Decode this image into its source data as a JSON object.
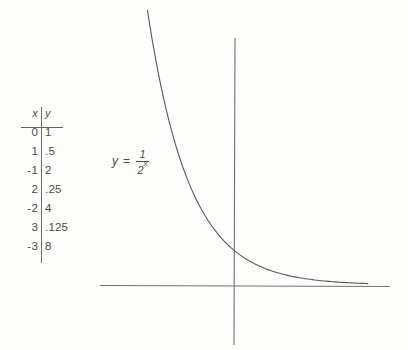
{
  "figure": {
    "kind": "math-graph",
    "background_color": "#fdfdfc",
    "stroke_color": "#5e5e63",
    "text_color": "#4d4d4d"
  },
  "equation": {
    "lhs": "y",
    "equals": "=",
    "numerator": "1",
    "denominator_base": "2",
    "denominator_exponent": "x",
    "plain": "y = 1/2^x"
  },
  "table": {
    "header": {
      "x": "x",
      "y": "y"
    },
    "rows": [
      {
        "x": "0",
        "y": "1"
      },
      {
        "x": "1",
        "y": ".5"
      },
      {
        "x": "-1",
        "y": "2"
      },
      {
        "x": "2",
        "y": ".25"
      },
      {
        "x": "-2",
        "y": "4"
      },
      {
        "x": "3",
        "y": ".125"
      },
      {
        "x": "-3",
        "y": "8"
      }
    ]
  },
  "chart_data": {
    "type": "line",
    "title": "",
    "subtitle": "",
    "xlabel": "",
    "ylabel": "",
    "annotations": [
      {
        "text": "y = 1/2^x",
        "x_px": 112,
        "y_px": 148
      }
    ],
    "legend": [],
    "legend_position": "none",
    "grid": false,
    "axes": {
      "x_axis": {
        "orientation": "horizontal",
        "y_px": 285,
        "x_start_px": 100,
        "x_end_px": 390
      },
      "y_axis": {
        "orientation": "vertical",
        "x_px": 235,
        "y_start_px": 38,
        "y_end_px": 345
      }
    },
    "xlim": [
      -3.2,
      4.6
    ],
    "ylim": [
      0,
      9.2
    ],
    "series": [
      {
        "name": "y = 1/2^x",
        "function": "y = 2^(-x)",
        "color": "#5a5a60",
        "x": [
          -3,
          -2.5,
          -2,
          -1.5,
          -1,
          -0.5,
          0,
          0.5,
          1,
          1.5,
          2,
          2.5,
          3,
          3.5,
          4,
          4.5
        ],
        "y": [
          8,
          5.657,
          4,
          2.828,
          2,
          1.414,
          1,
          0.707,
          0.5,
          0.354,
          0.25,
          0.177,
          0.125,
          0.088,
          0.0625,
          0.044
        ]
      }
    ],
    "table_points": {
      "x": [
        0,
        1,
        -1,
        2,
        -2,
        3,
        -3
      ],
      "y": [
        1,
        0.5,
        2,
        0.25,
        4,
        0.125,
        8
      ]
    }
  }
}
